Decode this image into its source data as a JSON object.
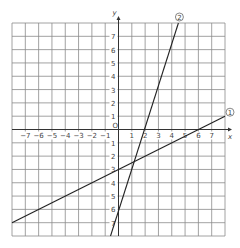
{
  "chart_data": {
    "type": "line",
    "title": "",
    "xlabel": "x",
    "ylabel": "y",
    "origin_label": "O",
    "xlim": [
      -8,
      8
    ],
    "ylim": [
      -8,
      8
    ],
    "grid": true,
    "x_ticks": [
      -7,
      -6,
      -5,
      -4,
      -3,
      -2,
      -1,
      1,
      2,
      3,
      4,
      5,
      6,
      7
    ],
    "y_ticks": [
      7,
      6,
      5,
      4,
      3,
      2,
      1,
      -1,
      -2,
      -3,
      -4,
      -5,
      -6,
      -7
    ],
    "series": [
      {
        "name": "①",
        "equation": "y = x/2 - 3",
        "slope": 0.5,
        "intercept": -3,
        "x": [
          -8,
          8
        ],
        "y": [
          -7,
          1
        ]
      },
      {
        "name": "②",
        "equation": "y = 3x - 3",
        "slope": 3,
        "intercept": -3,
        "x": [
          -0.6,
          4.5
        ],
        "y": [
          -8,
          8
        ]
      }
    ],
    "intersection": {
      "x": 0,
      "y": -3
    }
  },
  "labels": {
    "x_axis": "x",
    "y_axis": "y",
    "origin": "O",
    "line1": "1",
    "line2": "2"
  }
}
